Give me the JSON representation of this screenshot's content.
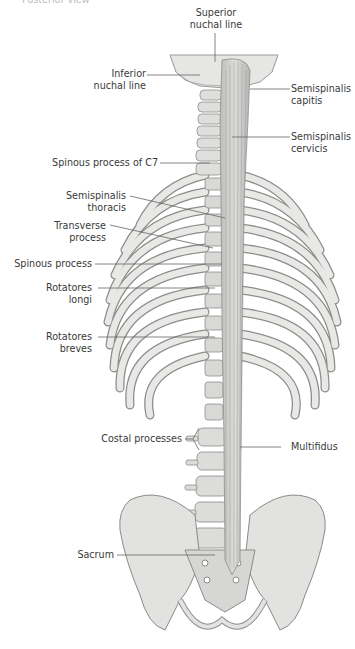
{
  "figure": {
    "caption_top_cut": "Posterior view",
    "labels": {
      "superior_nuchal_line": [
        "Superior",
        "nuchal line"
      ],
      "inferior_nuchal_line": [
        "Inferior",
        "nuchal line"
      ],
      "semispinalis_capitis": [
        "Semispinalis",
        "capitis"
      ],
      "semispinalis_cervicis": [
        "Semispinalis",
        "cervicis"
      ],
      "spinous_process_c7": "Spinous process of C7",
      "semispinalis_thoracis": [
        "Semispinalis",
        "thoracis"
      ],
      "transverse_process": [
        "Transverse",
        "process"
      ],
      "spinous_process": "Spinous process",
      "rotatores_longi": [
        "Rotatores",
        "longi"
      ],
      "rotatores_breves": [
        "Rotatores",
        "breves"
      ],
      "costal_processes": "Costal processes",
      "multifidus": "Multifidus",
      "sacrum": "Sacrum"
    },
    "colors": {
      "bone": "#e4e4e2",
      "bone_shadow": "#a9a9a7",
      "muscle": "#c9c9c7",
      "cavity": "#6b6b6b",
      "leader_line": "#666666",
      "text": "#3a3a3a"
    }
  }
}
